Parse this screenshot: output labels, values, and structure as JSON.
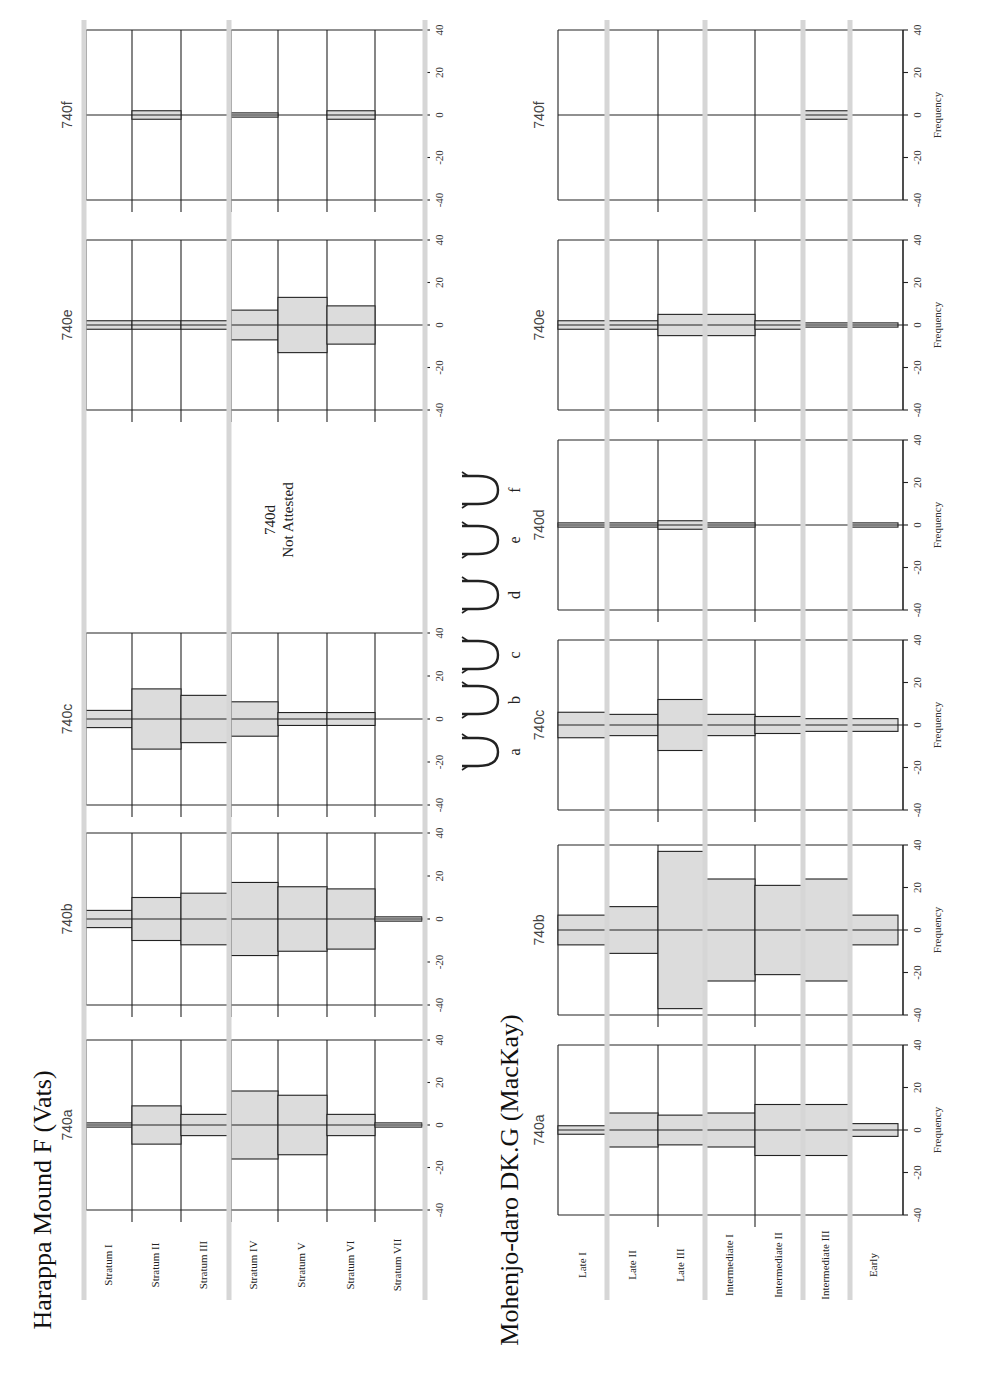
{
  "chart_data": [
    {
      "type": "bar",
      "subtype": "battleship-curve (symmetric frequency bars)",
      "title": "Harappa Mound F (Vats)",
      "ylabel": "",
      "ylim": [
        -40,
        40
      ],
      "yticks": [
        -40,
        -20,
        0,
        20,
        40
      ],
      "categories": [
        "Stratum I",
        "Stratum II",
        "Stratum III",
        "Stratum IV",
        "Stratum V",
        "Stratum VI",
        "Stratum VII"
      ],
      "series": [
        {
          "name": "740a",
          "values": [
            1,
            9,
            5,
            16,
            14,
            5,
            1
          ]
        },
        {
          "name": "740b",
          "values": [
            4,
            10,
            12,
            17,
            15,
            14,
            1
          ]
        },
        {
          "name": "740c",
          "values": [
            4,
            14,
            11,
            8,
            3,
            3,
            0
          ]
        },
        {
          "name": "740d",
          "values": null,
          "note": "Not Attested"
        },
        {
          "name": "740e",
          "values": [
            2,
            2,
            2,
            7,
            13,
            9,
            0
          ]
        },
        {
          "name": "740f",
          "values": [
            0,
            2,
            0,
            1,
            0,
            2,
            0
          ]
        }
      ]
    },
    {
      "type": "bar",
      "subtype": "battleship-curve (symmetric frequency bars)",
      "title": "Mohenjo-daro DK.G (MacKay)",
      "ylabel": "Frequency",
      "ylim": [
        -40,
        40
      ],
      "yticks": [
        -40,
        -20,
        0,
        20,
        40
      ],
      "categories": [
        "Late I",
        "Late II",
        "Late III",
        "Intermediate I",
        "Intermediate II",
        "Intermediate III",
        "Early"
      ],
      "series": [
        {
          "name": "740a",
          "values": [
            2,
            8,
            7,
            8,
            12,
            12,
            3
          ]
        },
        {
          "name": "740b",
          "values": [
            7,
            11,
            37,
            24,
            21,
            24,
            7
          ]
        },
        {
          "name": "740c",
          "values": [
            6,
            5,
            12,
            5,
            4,
            3,
            3
          ]
        },
        {
          "name": "740d",
          "values": [
            1,
            1,
            2,
            1,
            0,
            0,
            1
          ]
        },
        {
          "name": "740e",
          "values": [
            2,
            2,
            5,
            5,
            2,
            1,
            1
          ]
        },
        {
          "name": "740f",
          "values": [
            0,
            0,
            0,
            0,
            0,
            2,
            0
          ]
        }
      ]
    }
  ],
  "titles": {
    "harappa": "Harappa Mound F (Vats)",
    "mohenjo": "Mohenjo-daro DK.G (MacKay)"
  },
  "not_attested": {
    "label": "740d",
    "text": "Not Attested"
  },
  "axis_label": "Frequency",
  "sign_variants": {
    "glyphs": [
      "a",
      "b",
      "c",
      "d",
      "e",
      "f"
    ]
  }
}
